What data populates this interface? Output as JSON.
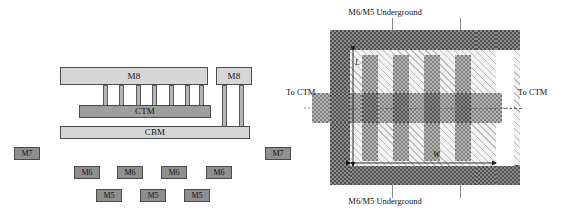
{
  "figure": {
    "name": "inductor-cross-section-and-layout",
    "panels": [
      "cross-section",
      "top-view-layout"
    ]
  },
  "cross_section": {
    "top_plate_label": "M8",
    "side_plate_label": "M8",
    "ctm_label": "CTM",
    "cbm_label": "CBM",
    "via_count_top": 7,
    "via_count_side": 2,
    "floating_tags": [
      {
        "label": "M7",
        "x": 14,
        "y": 147
      },
      {
        "label": "M7",
        "x": 265,
        "y": 147
      },
      {
        "label": "M6",
        "x": 74,
        "y": 166
      },
      {
        "label": "M6",
        "x": 117,
        "y": 166
      },
      {
        "label": "M6",
        "x": 161,
        "y": 166
      },
      {
        "label": "M6",
        "x": 206,
        "y": 166
      },
      {
        "label": "M5",
        "x": 96,
        "y": 189
      },
      {
        "label": "M5",
        "x": 140,
        "y": 189
      },
      {
        "label": "M5",
        "x": 184,
        "y": 189
      }
    ]
  },
  "layout": {
    "label_top": "M6/M5 Underground",
    "label_bottom": "M6/M5 Underground",
    "label_left": "To CTM",
    "label_right": "To CTM",
    "dim_length": "L",
    "dim_width": "W",
    "finger_count_top": 4,
    "finger_count_bottom": 4
  },
  "colors": {
    "metal_light": "#d6d6d6",
    "metal_mid": "#9e9e9e",
    "tag_fill": "#8f8f8f",
    "outline": "#4a4a4a",
    "check_dark": "#4f4f4f",
    "check_mid": "#7d7d7d",
    "hatch_line": "#bdbdbd"
  }
}
